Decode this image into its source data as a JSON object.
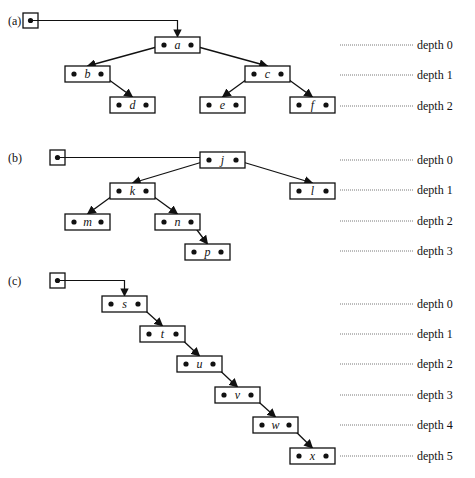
{
  "diagram": {
    "panels": [
      {
        "label": "(a)",
        "root_pointer": {
          "x": 23,
          "y": 13
        },
        "nodes": [
          {
            "id": "a",
            "x": 155,
            "y": 37
          },
          {
            "id": "b",
            "x": 65,
            "y": 66
          },
          {
            "id": "c",
            "x": 245,
            "y": 66
          },
          {
            "id": "d",
            "x": 110,
            "y": 97
          },
          {
            "id": "e",
            "x": 200,
            "y": 97
          },
          {
            "id": "f",
            "x": 290,
            "y": 97
          }
        ],
        "edges": [
          {
            "from": "a",
            "side": "left",
            "to": "b"
          },
          {
            "from": "a",
            "side": "right",
            "to": "c"
          },
          {
            "from": "b",
            "side": "right",
            "to": "d"
          },
          {
            "from": "c",
            "side": "left",
            "to": "e"
          },
          {
            "from": "c",
            "side": "right",
            "to": "f"
          }
        ],
        "root": "a",
        "depths": [
          {
            "label": "depth 0",
            "y": 45
          },
          {
            "label": "depth 1",
            "y": 75
          },
          {
            "label": "depth 2",
            "y": 106
          }
        ]
      },
      {
        "label": "(b)",
        "root_pointer": {
          "x": 50,
          "y": 150
        },
        "nodes": [
          {
            "id": "j",
            "x": 200,
            "y": 152
          },
          {
            "id": "k",
            "x": 110,
            "y": 183
          },
          {
            "id": "l",
            "x": 290,
            "y": 183
          },
          {
            "id": "m",
            "x": 65,
            "y": 214
          },
          {
            "id": "n",
            "x": 155,
            "y": 214
          },
          {
            "id": "p",
            "x": 185,
            "y": 244
          }
        ],
        "edges": [
          {
            "from": "j",
            "side": "left",
            "to": "k"
          },
          {
            "from": "j",
            "side": "right",
            "to": "l"
          },
          {
            "from": "k",
            "side": "left",
            "to": "m"
          },
          {
            "from": "k",
            "side": "right",
            "to": "n"
          },
          {
            "from": "n",
            "side": "right",
            "to": "p"
          }
        ],
        "root": "j",
        "depths": [
          {
            "label": "depth 0",
            "y": 160
          },
          {
            "label": "depth 1",
            "y": 190
          },
          {
            "label": "depth 2",
            "y": 221
          },
          {
            "label": "depth 3",
            "y": 251
          }
        ]
      },
      {
        "label": "(c)",
        "root_pointer": {
          "x": 50,
          "y": 273
        },
        "nodes": [
          {
            "id": "s",
            "x": 102,
            "y": 296
          },
          {
            "id": "t",
            "x": 140,
            "y": 326
          },
          {
            "id": "u",
            "x": 177,
            "y": 356
          },
          {
            "id": "v",
            "x": 215,
            "y": 387
          },
          {
            "id": "w",
            "x": 253,
            "y": 417
          },
          {
            "id": "x",
            "x": 290,
            "y": 448
          }
        ],
        "edges": [
          {
            "from": "s",
            "side": "right",
            "to": "t"
          },
          {
            "from": "t",
            "side": "right",
            "to": "u"
          },
          {
            "from": "u",
            "side": "right",
            "to": "v"
          },
          {
            "from": "v",
            "side": "right",
            "to": "w"
          },
          {
            "from": "w",
            "side": "right",
            "to": "x"
          }
        ],
        "root": "s",
        "depths": [
          {
            "label": "depth 0",
            "y": 304
          },
          {
            "label": "depth 1",
            "y": 334
          },
          {
            "label": "depth 2",
            "y": 364
          },
          {
            "label": "depth 3",
            "y": 395
          },
          {
            "label": "depth 4",
            "y": 425
          },
          {
            "label": "depth 5",
            "y": 456
          }
        ]
      }
    ],
    "layout": {
      "node_width": 45,
      "node_height": 16,
      "root_box_size": 15,
      "depth_line_x1": 340,
      "depth_line_x2": 413,
      "depth_label_x": 417
    }
  }
}
